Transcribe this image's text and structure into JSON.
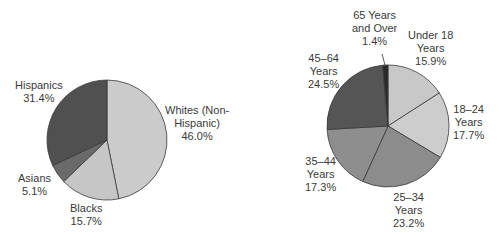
{
  "chart_data": [
    {
      "type": "pie",
      "title": "",
      "slices": [
        {
          "label": "Whites (Non-Hispanic)",
          "value": 46.0,
          "color": "#cbcbcb"
        },
        {
          "label": "Blacks",
          "value": 15.7,
          "color": "#c6c6c6"
        },
        {
          "label": "Asians",
          "value": 5.1,
          "color": "#6a6a6a"
        },
        {
          "label": "Hispanics",
          "value": 31.4,
          "color": "#505050"
        }
      ]
    },
    {
      "type": "pie",
      "title": "",
      "slices": [
        {
          "label": "Under 18 Years",
          "value": 15.9,
          "color": "#c8c8c8"
        },
        {
          "label": "18–24 Years",
          "value": 17.7,
          "color": "#cdcdcd"
        },
        {
          "label": "25–34 Years",
          "value": 23.2,
          "color": "#8c8c8c"
        },
        {
          "label": "35–44 Years",
          "value": 17.3,
          "color": "#8e8e8e"
        },
        {
          "label": "45–64 Years",
          "value": 24.5,
          "color": "#555555"
        },
        {
          "label": "65 Years and Over",
          "value": 1.4,
          "color": "#2a2a2a"
        }
      ]
    }
  ],
  "labels": {
    "left": {
      "whites": [
        "Whites (Non-",
        "Hispanic)",
        "46.0%"
      ],
      "blacks": [
        "Blacks",
        "15.7%"
      ],
      "asians": [
        "Asians",
        "5.1%"
      ],
      "hispanics": [
        "Hispanics",
        "31.4%"
      ]
    },
    "right": {
      "under18": [
        "Under 18",
        "Years",
        "15.9%"
      ],
      "y18_24": [
        "18–24",
        "Years",
        "17.7%"
      ],
      "y25_34": [
        "25–34",
        "Years",
        "23.2%"
      ],
      "y35_44": [
        "35–44",
        "Years",
        "17.3%"
      ],
      "y45_64": [
        "45–64",
        "Years",
        "24.5%"
      ],
      "y65": [
        "65 Years",
        "and Over",
        "1.4%"
      ]
    }
  }
}
